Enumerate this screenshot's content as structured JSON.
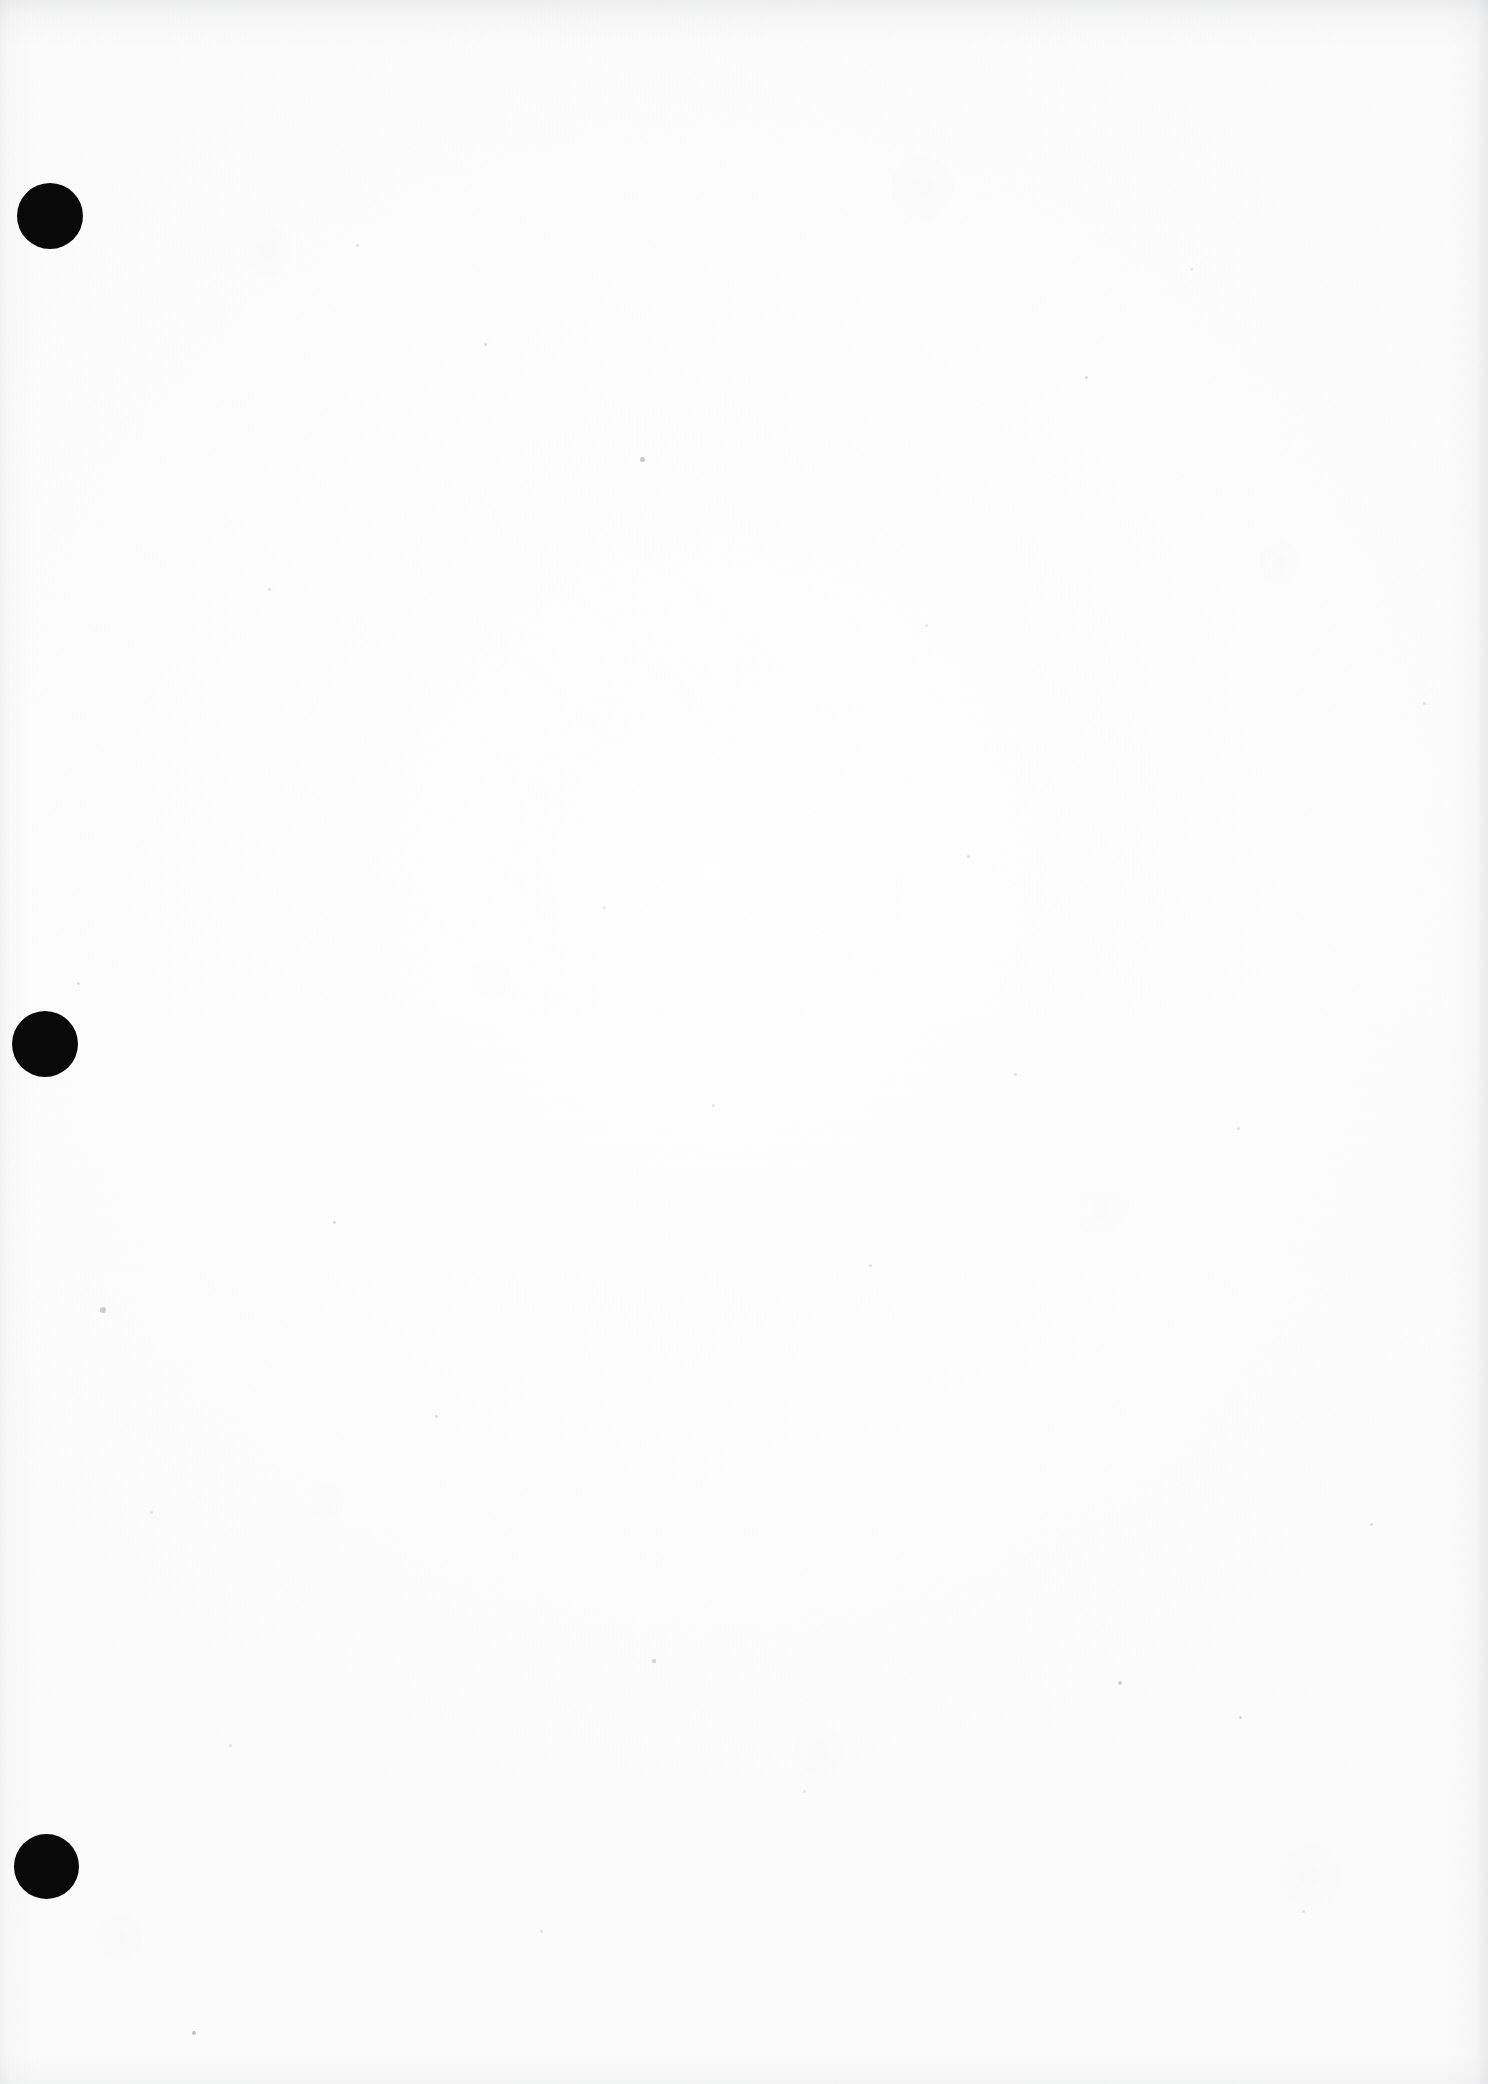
{
  "document": {
    "kind": "scanned-page",
    "page_label": "",
    "visible_text": "",
    "is_blank": true,
    "background_color": "#fefefe",
    "ink_color": "#090909",
    "width": 1488,
    "height": 2084
  },
  "punch_holes": {
    "count": 3,
    "color": "#090909",
    "items": [
      {
        "name": "punch-hole-top",
        "cx": 50,
        "cy": 216,
        "d": 66
      },
      {
        "name": "punch-hole-middle",
        "cx": 45,
        "cy": 1044,
        "d": 66
      },
      {
        "name": "punch-hole-bottom",
        "cx": 46,
        "cy": 1866,
        "d": 65
      }
    ]
  },
  "specks": [
    {
      "x": 640,
      "y": 457,
      "s": 5,
      "o": 0.55
    },
    {
      "x": 100,
      "y": 1307,
      "s": 6,
      "o": 0.5
    },
    {
      "x": 192,
      "y": 2031,
      "s": 4,
      "o": 0.6
    },
    {
      "x": 1118,
      "y": 1681,
      "s": 4,
      "o": 0.45
    },
    {
      "x": 652,
      "y": 1659,
      "s": 3.5,
      "o": 0.45
    },
    {
      "x": 1085,
      "y": 376,
      "s": 3,
      "o": 0.35
    },
    {
      "x": 484,
      "y": 343,
      "s": 3,
      "o": 0.35
    },
    {
      "x": 1239,
      "y": 1716,
      "s": 3,
      "o": 0.35
    },
    {
      "x": 333,
      "y": 1221,
      "s": 3,
      "o": 0.3
    },
    {
      "x": 869,
      "y": 1264,
      "s": 3,
      "o": 0.3
    },
    {
      "x": 435,
      "y": 1415,
      "s": 2.5,
      "o": 0.3
    },
    {
      "x": 77,
      "y": 982,
      "s": 3,
      "o": 0.32
    },
    {
      "x": 1237,
      "y": 1127,
      "s": 3,
      "o": 0.28
    },
    {
      "x": 967,
      "y": 855,
      "s": 2.5,
      "o": 0.28
    },
    {
      "x": 268,
      "y": 588,
      "s": 2.5,
      "o": 0.25
    },
    {
      "x": 1370,
      "y": 1523,
      "s": 2.5,
      "o": 0.25
    },
    {
      "x": 1014,
      "y": 1073,
      "s": 2.5,
      "o": 0.25
    },
    {
      "x": 712,
      "y": 1104,
      "s": 2.5,
      "o": 0.25
    },
    {
      "x": 356,
      "y": 244,
      "s": 2.5,
      "o": 0.25
    },
    {
      "x": 150,
      "y": 1511,
      "s": 2.5,
      "o": 0.22
    },
    {
      "x": 540,
      "y": 1930,
      "s": 2.5,
      "o": 0.22
    },
    {
      "x": 1423,
      "y": 702,
      "s": 2.5,
      "o": 0.22
    },
    {
      "x": 803,
      "y": 1790,
      "s": 2.5,
      "o": 0.2
    },
    {
      "x": 1302,
      "y": 1910,
      "s": 2.5,
      "o": 0.2
    },
    {
      "x": 229,
      "y": 1744,
      "s": 2.5,
      "o": 0.2
    },
    {
      "x": 925,
      "y": 624,
      "s": 2.5,
      "o": 0.2
    },
    {
      "x": 603,
      "y": 906,
      "s": 2.5,
      "o": 0.2
    },
    {
      "x": 1190,
      "y": 268,
      "s": 2.5,
      "o": 0.2
    }
  ]
}
